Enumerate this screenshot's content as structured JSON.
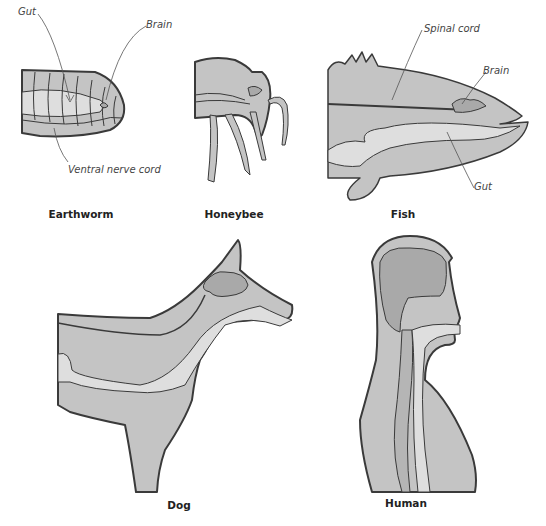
{
  "figure": {
    "panels": [
      {
        "id": "earthworm",
        "caption": "Earthworm",
        "labels": [
          "Gut",
          "Brain",
          "Ventral nerve cord"
        ]
      },
      {
        "id": "honeybee",
        "caption": "Honeybee",
        "labels": []
      },
      {
        "id": "fish",
        "caption": "Fish",
        "labels": [
          "Spinal cord",
          "Brain",
          "Gut"
        ]
      },
      {
        "id": "dog",
        "caption": "Dog",
        "labels": []
      },
      {
        "id": "human",
        "caption": "Human",
        "labels": []
      }
    ]
  },
  "colors": {
    "body_fill": "#c4c4c4",
    "gut_fill": "#dedede",
    "brain_fill": "#a9a9a9",
    "outline": "#3a3a3a"
  }
}
